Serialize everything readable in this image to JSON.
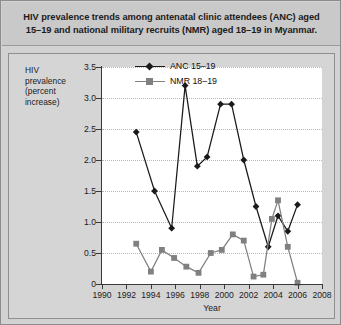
{
  "title": "HIV prevalence trends among antenatal clinic attendees (ANC) aged 15–19 and national military recruits (NMR) aged 18–19 in Myanmar.",
  "colors": {
    "background": "#d2d2d2",
    "panel": "#d5d5d5",
    "plot": "#ffffff",
    "anc": "#1a1a1a",
    "nmr": "#808080",
    "axis": "#3a3a3a",
    "grid": "#b9b9b9"
  },
  "legend": {
    "position": "top-right",
    "entries": [
      {
        "label": "ANC 15–19",
        "marker": "diamond",
        "color": "#1a1a1a"
      },
      {
        "label": "NMR 18–19",
        "marker": "square",
        "color": "#808080"
      }
    ]
  },
  "chart_data": {
    "type": "line",
    "title": "HIV prevalence trends among antenatal clinic attendees (ANC) aged 15–19 and national military recruits (NMR) aged 18–19 in Myanmar.",
    "xlabel": "Year",
    "ylabel": "HIV prevalence (percent increase)",
    "xlim": [
      1990,
      2008
    ],
    "ylim": [
      0,
      3.5
    ],
    "xticks": [
      1990,
      1992,
      1994,
      1996,
      1998,
      2000,
      2002,
      2004,
      2006,
      2008
    ],
    "yticks": [
      0,
      0.5,
      1.0,
      1.5,
      2.0,
      2.5,
      3.0,
      3.5
    ],
    "ytick_labels": [
      "0",
      "0.5",
      "1.0",
      "1.5",
      "2.0",
      "2.5",
      "3.0",
      "3.5"
    ],
    "grid": true,
    "grid_axis": "y",
    "legend_position": "top-right",
    "series": [
      {
        "name": "ANC 15–19",
        "marker": "diamond",
        "color": "#1a1a1a",
        "x": [
          1992.8,
          1994.3,
          1995.7,
          1996.8,
          1997.8,
          1998.6,
          1999.7,
          2000.6,
          2001.6,
          2002.6,
          2003.6,
          2004.4,
          2005.2,
          2006.0
        ],
        "y": [
          2.45,
          1.5,
          0.9,
          3.2,
          1.9,
          2.05,
          2.9,
          2.9,
          2.0,
          1.25,
          0.6,
          1.1,
          0.85,
          1.28
        ]
      },
      {
        "name": "NMR 18–19",
        "marker": "square",
        "color": "#808080",
        "x": [
          1992.8,
          1994.0,
          1994.9,
          1995.9,
          1996.9,
          1997.9,
          1998.9,
          1999.8,
          2000.7,
          2001.6,
          2002.4,
          2003.2,
          2003.9,
          2004.4,
          2005.2,
          2006.0
        ],
        "y": [
          0.65,
          0.2,
          0.55,
          0.42,
          0.28,
          0.18,
          0.5,
          0.55,
          0.8,
          0.7,
          0.12,
          0.15,
          1.05,
          1.35,
          0.6,
          0.02
        ]
      }
    ]
  }
}
